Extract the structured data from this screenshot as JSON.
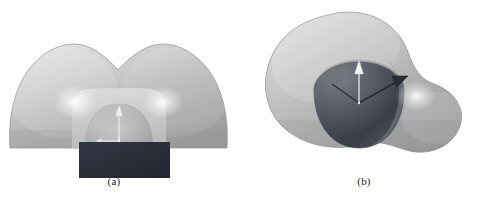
{
  "figure": {
    "kind": "scientific-figure",
    "background_color": "#ffffff",
    "width_px": 480,
    "height_px": 204,
    "panel_count": 2
  },
  "panels": [
    {
      "id": "a",
      "caption": "(a)",
      "view": "front cross-section view",
      "description": "Bilobed outer isosurface lobe sliced flat at the bottom, with an inner dome-shaped isosurface and a dark rectangular substrate block below, plus a small coordinate axis triad at the center.",
      "objects": [
        {
          "name": "outer-isosurface",
          "shape": "bilobed-dome",
          "fill_light": "#dcdcdc",
          "fill_mid": "#b4b4b4",
          "fill_dark": "#9a9a9a",
          "outline": "#8d8d8d"
        },
        {
          "name": "inner-shelf",
          "shape": "rounded-rectangle",
          "fill": "#cfcfcf"
        },
        {
          "name": "inner-dome",
          "shape": "half-dome",
          "fill_light": "#bdbdbd",
          "fill_dark": "#a0a0a0"
        },
        {
          "name": "substrate-block",
          "shape": "rectangle",
          "fill": "#2b2f3a"
        },
        {
          "name": "specular-highlight-left",
          "shape": "radial-glow",
          "fill": "#ffffff"
        },
        {
          "name": "specular-highlight-right",
          "shape": "radial-glow",
          "fill": "#ffffff"
        }
      ],
      "axes": {
        "name": "coordinate-triad",
        "color": "#efefef",
        "arrows": [
          "z-up",
          "x-left",
          "y-down"
        ]
      }
    },
    {
      "id": "b",
      "caption": "(b)",
      "view": "perspective 3D view",
      "description": "Peanut / dumbbell shaped outer isosurface seen obliquely, with a dark rounded inner sphere cut by a plane, and a coordinate axis triad with a tilted arrow at the center.",
      "objects": [
        {
          "name": "outer-isosurface",
          "shape": "peanut-lobe",
          "fill_light": "#d8d8d8",
          "fill_mid": "#b0b0b0",
          "fill_dark": "#9c9c9c",
          "outline": "#8b8b8b"
        },
        {
          "name": "inner-sphere",
          "shape": "rounded-sphere",
          "fill_light": "#8f8f8f",
          "fill_dark": "#3e424b"
        },
        {
          "name": "cut-plane-disc",
          "shape": "ellipse",
          "fill": "#a8a8a8"
        },
        {
          "name": "specular-highlight",
          "shape": "radial-glow",
          "fill": "#ffffff"
        }
      ],
      "axes": {
        "name": "coordinate-triad",
        "color": "#f2f2f2",
        "arrows": [
          "z-up",
          "tilted-right",
          "base-v"
        ]
      }
    }
  ]
}
